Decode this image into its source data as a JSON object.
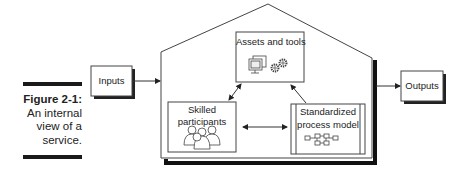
{
  "caption": {
    "figure_label": "Figure 2-1:",
    "description_lines": [
      "An internal",
      "view of a",
      "service."
    ]
  },
  "diagram": {
    "title": "An internal view of a service",
    "external": {
      "inputs": "Inputs",
      "outputs": "Outputs"
    },
    "components": {
      "assets": {
        "label": "Assets and tools",
        "icons": [
          "computer-monitors-icon",
          "gears-icon"
        ]
      },
      "participants": {
        "label_line1": "Skilled",
        "label_line2": "participants",
        "icons": [
          "people-group-icon"
        ]
      },
      "process": {
        "label_line1": "Standardized",
        "label_line2": "process model",
        "icons": [
          "flowchart-icon"
        ]
      }
    },
    "connections": [
      {
        "from": "Inputs",
        "to": "service",
        "type": "one-way"
      },
      {
        "from": "service",
        "to": "Outputs",
        "type": "one-way"
      },
      {
        "from": "Assets and tools",
        "to": "Skilled participants",
        "type": "two-way"
      },
      {
        "from": "Standardized process model",
        "to": "Assets and tools",
        "type": "one-way"
      },
      {
        "from": "Skilled participants",
        "to": "Standardized process model",
        "type": "two-way"
      }
    ],
    "colors": {
      "line": "#333333",
      "shadow": "#111111",
      "fill": "#ffffff"
    }
  }
}
